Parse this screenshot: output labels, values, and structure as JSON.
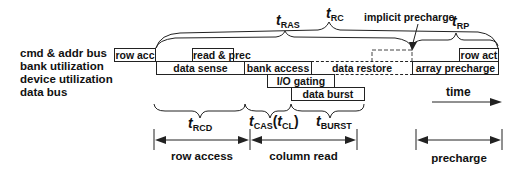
{
  "row_labels": [
    "cmd & addr bus",
    "bank utilization",
    "device utilization",
    "data bus"
  ],
  "boxes": {
    "row_acc": "row acc",
    "read_prec": "read & prec",
    "data_sense": "data sense",
    "bank_access": "bank access",
    "data_restore": "data restore",
    "array_precharge": "array precharge",
    "row_act": "row act",
    "io_gating": "I/O gating",
    "data_burst": "data burst"
  },
  "timing": {
    "t_ras": {
      "t": "t",
      "sub": "RAS"
    },
    "t_rc": {
      "t": "t",
      "sub": "RC"
    },
    "t_rp": {
      "t": "t",
      "sub": "RP"
    },
    "t_rcd": {
      "t": "t",
      "sub": "RCD"
    },
    "t_cas": {
      "t": "t",
      "sub": "CAS",
      "paren_t": "t",
      "paren_sub": "CL"
    },
    "t_burst": {
      "t": "t",
      "sub": "BURST"
    }
  },
  "annotations": {
    "implicit_precharge": "implicit precharge",
    "time": "time"
  },
  "phases": {
    "row_access": "row access",
    "column_read": "column read",
    "precharge": "precharge"
  }
}
